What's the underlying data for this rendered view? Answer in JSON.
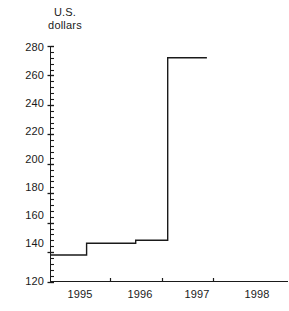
{
  "chart_data": {
    "type": "line",
    "title": "",
    "ylabel_line1": "U.S.",
    "ylabel_line2": "dollars",
    "xlabel": "",
    "ylim": [
      120,
      280
    ],
    "xlim": [
      1994.35,
      1998.95
    ],
    "ytick_labels": [
      "280",
      "260",
      "240",
      "220",
      "200",
      "180",
      "160",
      "140",
      "120"
    ],
    "ytick_values": [
      280,
      260,
      240,
      220,
      200,
      180,
      160,
      140,
      120
    ],
    "y_minor_tick_step": 4,
    "xtick_labels": [
      "1995",
      "1996",
      "1997",
      "1998"
    ],
    "xtick_values": [
      1995,
      1996,
      1997,
      1998
    ],
    "x_tick_mark_values": [
      1995.5,
      1996.5,
      1997.5
    ],
    "grid": false,
    "legend": false,
    "line_color": "#1a1a1a",
    "line_style": "step",
    "series": [
      {
        "name": "U.S. dollars",
        "step_points": [
          {
            "x": 1994.35,
            "y": 138
          },
          {
            "x": 1995.05,
            "y": 138
          },
          {
            "x": 1995.05,
            "y": 146
          },
          {
            "x": 1996.0,
            "y": 146
          },
          {
            "x": 1996.0,
            "y": 148
          },
          {
            "x": 1996.62,
            "y": 148
          },
          {
            "x": 1996.62,
            "y": 272
          },
          {
            "x": 1997.38,
            "y": 272
          }
        ],
        "values_described": [
          138,
          146,
          148,
          272
        ]
      }
    ]
  }
}
